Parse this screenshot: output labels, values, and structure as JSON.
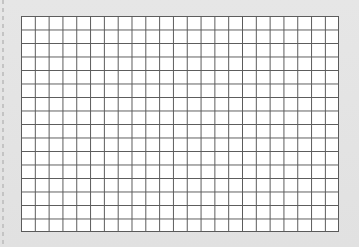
{
  "sheet": {
    "type": "graph-paper",
    "columns": 23,
    "rows": 16,
    "colors": {
      "background": "#e3e3e3",
      "paper": "#ffffff",
      "grid_line": "#5a5a5a",
      "perforation": "#c4c4c4"
    }
  }
}
